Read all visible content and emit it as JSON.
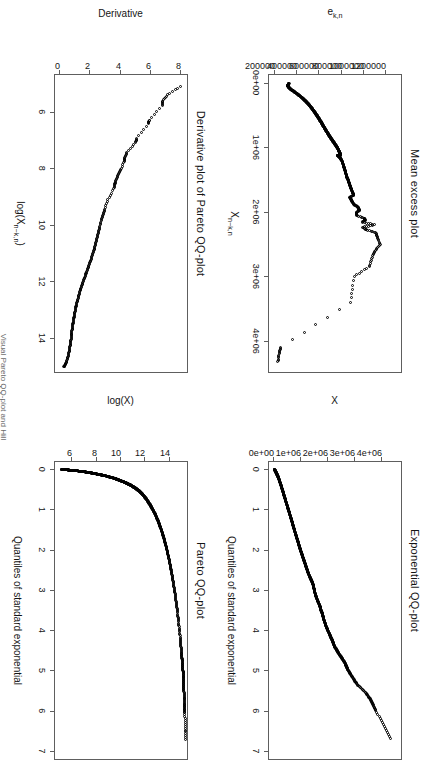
{
  "figure": {
    "caption_fragment": "Visual Pareto QQ-plot and Hill",
    "panel_count": 4
  },
  "chart_data": [
    {
      "id": "mean-excess",
      "type": "scatter",
      "title": "Mean excess plot",
      "xlabel": "X n-k,n",
      "ylabel": "e k,n",
      "xticks": [
        "0e+00",
        "1e+06",
        "2e+06",
        "3e+06",
        "4e+06"
      ],
      "xtickvals": [
        0,
        1000000,
        2000000,
        3000000,
        4000000
      ],
      "yticks": [
        "200000",
        "400000",
        "600000",
        "800000",
        "1000000",
        "1200000"
      ],
      "ytickvals": [
        200000,
        400000,
        600000,
        800000,
        1000000,
        1200000
      ],
      "xlim": [
        -120000,
        4480000
      ],
      "ylim": [
        150000,
        1330000
      ],
      "grid": false,
      "legend": "none",
      "points": [
        [
          10000,
          330000
        ],
        [
          25000,
          322000
        ],
        [
          40000,
          318000
        ],
        [
          55000,
          320000
        ],
        [
          70000,
          326000
        ],
        [
          85000,
          334000
        ],
        [
          100000,
          344000
        ],
        [
          115000,
          356000
        ],
        [
          130000,
          368000
        ],
        [
          145000,
          380000
        ],
        [
          160000,
          392000
        ],
        [
          175000,
          404000
        ],
        [
          190000,
          415000
        ],
        [
          205000,
          426000
        ],
        [
          220000,
          436000
        ],
        [
          235000,
          446000
        ],
        [
          250000,
          456000
        ],
        [
          265000,
          465000
        ],
        [
          280000,
          474000
        ],
        [
          295000,
          483000
        ],
        [
          310000,
          491000
        ],
        [
          325000,
          499000
        ],
        [
          340000,
          507000
        ],
        [
          355000,
          514000
        ],
        [
          370000,
          521000
        ],
        [
          385000,
          528000
        ],
        [
          400000,
          535000
        ],
        [
          415000,
          541000
        ],
        [
          430000,
          548000
        ],
        [
          445000,
          554000
        ],
        [
          460000,
          560000
        ],
        [
          475000,
          566000
        ],
        [
          490000,
          572000
        ],
        [
          505000,
          578000
        ],
        [
          520000,
          583000
        ],
        [
          535000,
          589000
        ],
        [
          550000,
          594000
        ],
        [
          565000,
          600000
        ],
        [
          580000,
          605000
        ],
        [
          595000,
          610000
        ],
        [
          610000,
          616000
        ],
        [
          625000,
          621000
        ],
        [
          640000,
          626000
        ],
        [
          655000,
          631000
        ],
        [
          670000,
          636000
        ],
        [
          685000,
          641000
        ],
        [
          700000,
          646000
        ],
        [
          715000,
          651000
        ],
        [
          730000,
          657000
        ],
        [
          745000,
          662000
        ],
        [
          760000,
          667000
        ],
        [
          775000,
          672000
        ],
        [
          790000,
          678000
        ],
        [
          805000,
          683000
        ],
        [
          820000,
          689000
        ],
        [
          835000,
          694000
        ],
        [
          850000,
          700000
        ],
        [
          865000,
          706000
        ],
        [
          880000,
          712000
        ],
        [
          895000,
          718000
        ],
        [
          910000,
          724000
        ],
        [
          925000,
          730000
        ],
        [
          940000,
          736000
        ],
        [
          955000,
          742000
        ],
        [
          970000,
          748000
        ],
        [
          985000,
          753000
        ],
        [
          1000000,
          758000
        ],
        [
          1015000,
          763000
        ],
        [
          1030000,
          768000
        ],
        [
          1045000,
          772000
        ],
        [
          1060000,
          776000
        ],
        [
          1075000,
          780000
        ],
        [
          1090000,
          784000
        ],
        [
          1105000,
          788000
        ],
        [
          1120000,
          792000
        ],
        [
          1120000,
          760000
        ],
        [
          1135000,
          770000
        ],
        [
          1150000,
          778000
        ],
        [
          1165000,
          786000
        ],
        [
          1180000,
          792000
        ],
        [
          1200000,
          800000
        ],
        [
          1230000,
          806000
        ],
        [
          1260000,
          812000
        ],
        [
          1290000,
          818000
        ],
        [
          1320000,
          822000
        ],
        [
          1350000,
          828000
        ],
        [
          1380000,
          833000
        ],
        [
          1410000,
          838000
        ],
        [
          1440000,
          843000
        ],
        [
          1470000,
          848000
        ],
        [
          1500000,
          856000
        ],
        [
          1530000,
          862000
        ],
        [
          1560000,
          868000
        ],
        [
          1590000,
          874000
        ],
        [
          1620000,
          880000
        ],
        [
          1650000,
          886000
        ],
        [
          1680000,
          893000
        ],
        [
          1710000,
          900000
        ],
        [
          1740000,
          907000
        ],
        [
          1770000,
          872000
        ],
        [
          1800000,
          880000
        ],
        [
          1830000,
          890000
        ],
        [
          1860000,
          900000
        ],
        [
          1890000,
          912000
        ],
        [
          1920000,
          944000
        ],
        [
          1950000,
          952000
        ],
        [
          1980000,
          958000
        ],
        [
          2010000,
          928000
        ],
        [
          2050000,
          930000
        ],
        [
          2100000,
          1000000
        ],
        [
          2130000,
          1010000
        ],
        [
          2160000,
          985000
        ],
        [
          2200000,
          1095000
        ],
        [
          2240000,
          990000
        ],
        [
          2280000,
          1020000
        ],
        [
          2320000,
          1105000
        ],
        [
          2400000,
          1118000
        ],
        [
          2500000,
          1145000
        ],
        [
          2600000,
          1100000
        ],
        [
          2700000,
          1075000
        ],
        [
          2850000,
          1045000
        ],
        [
          3000000,
          910000
        ],
        [
          3400000,
          880000
        ],
        [
          4100000,
          255000
        ],
        [
          4200000,
          240000
        ],
        [
          4320000,
          230000
        ]
      ]
    },
    {
      "id": "exponential-qq",
      "type": "scatter",
      "title": "Exponential QQ-plot",
      "xlabel": "Quantiles of standard exponential",
      "ylabel": "X",
      "xticks": [
        "0",
        "1",
        "2",
        "3",
        "4",
        "5",
        "6",
        "7"
      ],
      "xtickvals": [
        0,
        1,
        2,
        3,
        4,
        5,
        6,
        7
      ],
      "yticks": [
        "0e+00",
        "1e+06",
        "2e+06",
        "3e+06",
        "4e+06"
      ],
      "ytickvals": [
        0,
        1000000,
        2000000,
        3000000,
        4000000
      ],
      "xlim": [
        -0.18,
        7.2
      ],
      "ylim": [
        -180000,
        4700000
      ],
      "grid": false,
      "legend": "none",
      "curve": [
        [
          0.0,
          20000
        ],
        [
          0.05,
          60000
        ],
        [
          0.1,
          95000
        ],
        [
          0.15,
          130000
        ],
        [
          0.2,
          165000
        ],
        [
          0.3,
          215000
        ],
        [
          0.4,
          265000
        ],
        [
          0.5,
          310000
        ],
        [
          0.6,
          355000
        ],
        [
          0.7,
          400000
        ],
        [
          0.8,
          445000
        ],
        [
          0.9,
          490000
        ],
        [
          1.0,
          535000
        ],
        [
          1.1,
          580000
        ],
        [
          1.2,
          625000
        ],
        [
          1.3,
          668000
        ],
        [
          1.4,
          712000
        ],
        [
          1.5,
          755000
        ],
        [
          1.6,
          800000
        ],
        [
          1.7,
          845000
        ],
        [
          1.8,
          890000
        ],
        [
          1.9,
          935000
        ],
        [
          2.0,
          980000
        ],
        [
          2.1,
          1030000
        ],
        [
          2.2,
          1080000
        ],
        [
          2.3,
          1130000
        ],
        [
          2.4,
          1180000
        ],
        [
          2.5,
          1230000
        ],
        [
          2.6,
          1285000
        ],
        [
          2.7,
          1345000
        ],
        [
          2.8,
          1410000
        ],
        [
          2.9,
          1470000
        ],
        [
          3.0,
          1490000
        ],
        [
          3.1,
          1530000
        ],
        [
          3.2,
          1580000
        ],
        [
          3.3,
          1640000
        ],
        [
          3.4,
          1700000
        ],
        [
          3.5,
          1740000
        ],
        [
          3.6,
          1800000
        ],
        [
          3.7,
          1830000
        ],
        [
          3.8,
          1880000
        ],
        [
          3.9,
          1930000
        ],
        [
          4.0,
          1990000
        ],
        [
          4.1,
          2060000
        ],
        [
          4.2,
          2120000
        ],
        [
          4.3,
          2190000
        ],
        [
          4.4,
          2240000
        ],
        [
          4.5,
          2330000
        ],
        [
          4.6,
          2420000
        ],
        [
          4.7,
          2520000
        ],
        [
          4.8,
          2620000
        ],
        [
          4.9,
          2680000
        ],
        [
          5.0,
          2750000
        ],
        [
          5.15,
          2890000
        ],
        [
          5.35,
          3080000
        ],
        [
          5.55,
          3400000
        ],
        [
          5.75,
          3600000
        ],
        [
          6.0,
          3770000
        ],
        [
          6.7,
          4320000
        ]
      ]
    },
    {
      "id": "derivative-pareto-qq",
      "type": "scatter",
      "title": "Derivative plot of Pareto QQ-plot",
      "xlabel": "log(X n-k,n)",
      "ylabel": "Derivative",
      "xticks": [
        "6",
        "8",
        "10",
        "12",
        "14"
      ],
      "xtickvals": [
        6,
        8,
        10,
        12,
        14
      ],
      "yticks": [
        "0",
        "2",
        "4",
        "6",
        "8"
      ],
      "ytickvals": [
        0,
        2,
        4,
        6,
        8
      ],
      "xlim": [
        4.7,
        15.2
      ],
      "ylim": [
        -0.35,
        8.4
      ],
      "grid": false,
      "legend": "none",
      "curve": [
        [
          5.1,
          7.95
        ],
        [
          5.4,
          7.1
        ],
        [
          5.62,
          6.8
        ],
        [
          5.78,
          6.75
        ],
        [
          6.3,
          5.9
        ],
        [
          6.42,
          5.85
        ],
        [
          6.95,
          5.05
        ],
        [
          7.08,
          5.0
        ],
        [
          7.45,
          4.42
        ],
        [
          7.62,
          4.28
        ],
        [
          7.75,
          4.25
        ],
        [
          8.05,
          4.0
        ],
        [
          8.22,
          3.85
        ],
        [
          8.4,
          3.7
        ],
        [
          8.55,
          3.62
        ],
        [
          8.72,
          3.55
        ],
        [
          9.1,
          3.15
        ],
        [
          9.45,
          2.95
        ],
        [
          9.62,
          2.85
        ],
        [
          9.8,
          2.72
        ],
        [
          10.05,
          2.62
        ],
        [
          10.22,
          2.55
        ],
        [
          10.4,
          2.45
        ],
        [
          10.58,
          2.38
        ],
        [
          10.75,
          2.3
        ],
        [
          10.92,
          2.22
        ],
        [
          11.08,
          2.12
        ],
        [
          11.25,
          2.02
        ],
        [
          11.4,
          1.92
        ],
        [
          11.55,
          1.82
        ],
        [
          11.7,
          1.72
        ],
        [
          11.85,
          1.62
        ],
        [
          12.0,
          1.52
        ],
        [
          12.15,
          1.42
        ],
        [
          12.3,
          1.33
        ],
        [
          12.45,
          1.25
        ],
        [
          12.6,
          1.18
        ],
        [
          12.75,
          1.1
        ],
        [
          12.9,
          1.04
        ],
        [
          13.05,
          0.98
        ],
        [
          13.2,
          0.93
        ],
        [
          13.35,
          0.88
        ],
        [
          13.5,
          0.84
        ],
        [
          13.65,
          0.8
        ],
        [
          13.8,
          0.76
        ],
        [
          13.95,
          0.73
        ],
        [
          14.1,
          0.7
        ],
        [
          14.25,
          0.66
        ],
        [
          14.4,
          0.62
        ],
        [
          14.55,
          0.56
        ],
        [
          14.7,
          0.48
        ],
        [
          14.85,
          0.4
        ],
        [
          14.95,
          0.32
        ],
        [
          15.02,
          0.24
        ]
      ]
    },
    {
      "id": "pareto-qq",
      "type": "scatter",
      "title": "Pareto QQ-plot",
      "xlabel": "Quantiles of standard exponential",
      "ylabel": "log(X)",
      "xticks": [
        "0",
        "1",
        "2",
        "3",
        "4",
        "5",
        "6",
        "7"
      ],
      "xtickvals": [
        0,
        1,
        2,
        3,
        4,
        5,
        6,
        7
      ],
      "yticks": [
        "6",
        "8",
        "10",
        "12",
        "14"
      ],
      "ytickvals": [
        6,
        8,
        10,
        12,
        14
      ],
      "xlim": [
        -0.18,
        7.2
      ],
      "ylim": [
        4.6,
        15.4
      ],
      "grid": false,
      "legend": "none",
      "curve": [
        [
          0.004,
          5.1
        ],
        [
          0.01,
          5.4
        ],
        [
          0.016,
          5.62
        ],
        [
          0.022,
          5.78
        ],
        [
          0.035,
          6.3
        ],
        [
          0.042,
          6.42
        ],
        [
          0.06,
          6.95
        ],
        [
          0.068,
          7.08
        ],
        [
          0.085,
          7.45
        ],
        [
          0.095,
          7.62
        ],
        [
          0.105,
          7.75
        ],
        [
          0.12,
          8.05
        ],
        [
          0.13,
          8.22
        ],
        [
          0.142,
          8.4
        ],
        [
          0.152,
          8.55
        ],
        [
          0.165,
          8.72
        ],
        [
          0.195,
          9.1
        ],
        [
          0.225,
          9.45
        ],
        [
          0.245,
          9.62
        ],
        [
          0.265,
          9.8
        ],
        [
          0.295,
          10.05
        ],
        [
          0.315,
          10.22
        ],
        [
          0.34,
          10.4
        ],
        [
          0.365,
          10.58
        ],
        [
          0.39,
          10.75
        ],
        [
          0.42,
          10.92
        ],
        [
          0.45,
          11.08
        ],
        [
          0.485,
          11.25
        ],
        [
          0.52,
          11.4
        ],
        [
          0.56,
          11.55
        ],
        [
          0.605,
          11.7
        ],
        [
          0.655,
          11.85
        ],
        [
          0.71,
          12.0
        ],
        [
          0.775,
          12.15
        ],
        [
          0.845,
          12.3
        ],
        [
          0.92,
          12.45
        ],
        [
          1.0,
          12.6
        ],
        [
          1.09,
          12.75
        ],
        [
          1.19,
          12.9
        ],
        [
          1.3,
          13.05
        ],
        [
          1.42,
          13.2
        ],
        [
          1.55,
          13.35
        ],
        [
          1.7,
          13.5
        ],
        [
          1.87,
          13.65
        ],
        [
          2.06,
          13.8
        ],
        [
          2.27,
          13.95
        ],
        [
          2.5,
          14.1
        ],
        [
          2.76,
          14.25
        ],
        [
          3.05,
          14.4
        ],
        [
          3.38,
          14.55
        ],
        [
          3.76,
          14.7
        ],
        [
          4.2,
          14.85
        ],
        [
          4.55,
          14.95
        ],
        [
          4.8,
          15.02
        ],
        [
          5.03,
          15.08
        ],
        [
          5.25,
          15.12
        ],
        [
          5.48,
          15.15
        ],
        [
          5.8,
          15.18
        ],
        [
          6.05,
          15.22
        ],
        [
          6.72,
          15.3
        ]
      ]
    }
  ]
}
